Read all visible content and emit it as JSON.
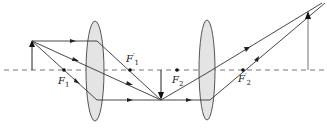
{
  "diagram": {
    "colors": {
      "ray": "#333333",
      "lens_fill": "#e4e4e4",
      "lens_stroke": "#555555",
      "axis": "#666666"
    },
    "optical_axis": {
      "y": 70,
      "style": "dashed"
    },
    "lenses": [
      {
        "name": "lens-1",
        "cx": 95,
        "cy": 71,
        "rx": 9,
        "ry": 50
      },
      {
        "name": "lens-2",
        "cx": 207,
        "cy": 70,
        "rx": 8,
        "ry": 50
      }
    ],
    "objects": {
      "object_arrow": {
        "x": 32,
        "y_base": 70,
        "y_tip": 41
      },
      "intermediate_image": {
        "x": 161,
        "y_base": 70,
        "y_tip": 100
      },
      "final_image": {
        "x": 308,
        "y_base": 70,
        "y_tip": 11
      }
    },
    "focal_points": [
      {
        "id": "F1",
        "x": 64,
        "y": 70,
        "label": "F",
        "sub": "1",
        "prime": false,
        "lx": 58,
        "ly": 76
      },
      {
        "id": "F1p",
        "x": 130,
        "y": 70,
        "label": "F",
        "sub": "1",
        "prime": true,
        "lx": 126,
        "ly": 54
      },
      {
        "id": "F2",
        "x": 177,
        "y": 70,
        "label": "F",
        "sub": "2",
        "prime": false,
        "lx": 172,
        "ly": 76
      },
      {
        "id": "F2p",
        "x": 243,
        "y": 70,
        "label": "F",
        "sub": "2",
        "prime": true,
        "lx": 238,
        "ly": 74
      }
    ],
    "labels": {
      "F1": "F",
      "F1_sub": "1",
      "F1p": "F",
      "F1p_sub": "1",
      "F1p_prime": "′",
      "F2": "F",
      "F2_sub": "2",
      "F2p": "F",
      "F2p_sub": "2",
      "F2p_prime": "′"
    }
  }
}
